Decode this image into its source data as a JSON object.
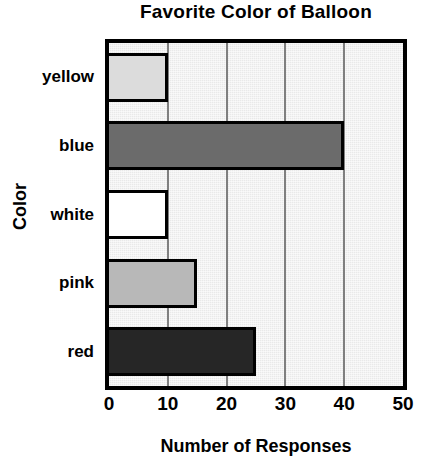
{
  "chart_data": {
    "type": "bar",
    "orientation": "horizontal",
    "title": "Favorite Color of Balloon",
    "xlabel": "Number of Responses",
    "ylabel": "Color",
    "categories": [
      "yellow",
      "blue",
      "white",
      "pink",
      "red"
    ],
    "values": [
      10,
      40,
      10,
      15,
      25
    ],
    "xlim": [
      0,
      50
    ],
    "xticks": [
      0,
      10,
      20,
      30,
      40,
      50
    ],
    "xtick_labels": [
      "0",
      "10",
      "20",
      "30",
      "40",
      "50"
    ],
    "grid": "vertical",
    "legend": "none",
    "plot_background": "#e9e9e9",
    "bar_colors": [
      "#dcdcdc",
      "#6b6b6b",
      "#ffffff",
      "#b8b8b8",
      "#262626"
    ],
    "bar_edge_color": "#000000",
    "gridline_color": "#808080",
    "axis_color": "#000000",
    "bars": [
      {
        "category": "yellow",
        "value": 10,
        "fill": "#dcdcdc"
      },
      {
        "category": "blue",
        "value": 40,
        "fill": "#6b6b6b"
      },
      {
        "category": "white",
        "value": 10,
        "fill": "#ffffff"
      },
      {
        "category": "pink",
        "value": 15,
        "fill": "#b8b8b8"
      },
      {
        "category": "red",
        "value": 25,
        "fill": "#262626"
      }
    ]
  }
}
